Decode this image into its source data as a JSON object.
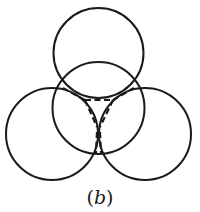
{
  "figure": {
    "caption_open": "(",
    "caption_letter": "b",
    "caption_close": ")",
    "stroke_color": "#1a1a1a",
    "circles": [
      {
        "name": "top-circle",
        "cx": 98.5,
        "cy": 53,
        "r": 45
      },
      {
        "name": "center-circle",
        "cx": 98.5,
        "cy": 108,
        "r": 46
      },
      {
        "name": "left-circle",
        "cx": 52,
        "cy": 134,
        "r": 46
      },
      {
        "name": "right-circle",
        "cx": 145,
        "cy": 134,
        "r": 46
      }
    ],
    "dashed_segments": [
      {
        "name": "dash-upper-left",
        "x1": 63,
        "y1": 88,
        "x2": 85,
        "y2": 100
      },
      {
        "name": "dash-top-horizontal",
        "x1": 85,
        "y1": 100,
        "x2": 113,
        "y2": 100
      },
      {
        "name": "dash-upper-right",
        "x1": 113,
        "y1": 100,
        "x2": 134,
        "y2": 88
      },
      {
        "name": "dash-v-left",
        "x1": 85,
        "y1": 100,
        "x2": 97,
        "y2": 127
      },
      {
        "name": "dash-v-right",
        "x1": 113,
        "y1": 100,
        "x2": 100,
        "y2": 127
      },
      {
        "name": "dash-stem-left",
        "x1": 97,
        "y1": 132,
        "x2": 96,
        "y2": 153
      },
      {
        "name": "dash-stem-right",
        "x1": 100,
        "y1": 132,
        "x2": 101,
        "y2": 153
      }
    ]
  }
}
